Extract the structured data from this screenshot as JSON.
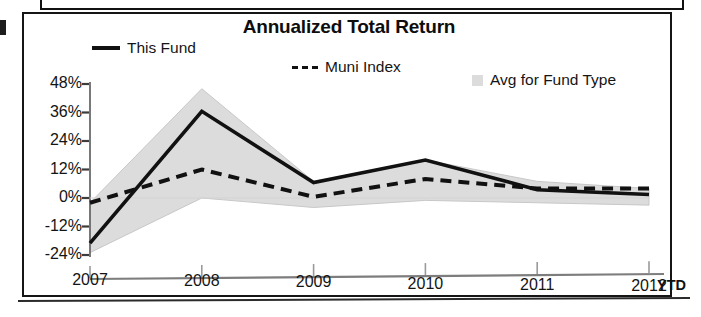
{
  "chart_data": {
    "type": "line",
    "title": "Annualized Total Return",
    "xlabel": "",
    "ylabel": "",
    "x": [
      "2007",
      "2008",
      "2009",
      "2010",
      "2011",
      "2012"
    ],
    "categories": [
      "2007",
      "2008",
      "2009",
      "2010",
      "2011",
      "2012"
    ],
    "x_tick_labels": [
      "2007",
      "2008",
      "2009",
      "2010",
      "2011",
      "2012"
    ],
    "x_axis_note": "YTD",
    "y_tick_labels": [
      "48%",
      "36%",
      "24%",
      "12%",
      "0%",
      "-12%",
      "-24%"
    ],
    "y_tick_values": [
      48,
      36,
      24,
      12,
      0,
      -12,
      -24
    ],
    "ylim": [
      -24,
      48
    ],
    "y_unit": "%",
    "grid": false,
    "legend_position": "top",
    "series": [
      {
        "name": "This Fund",
        "style": "solid",
        "color": "#111111",
        "values": [
          -19.0,
          36.5,
          6.5,
          16.0,
          3.5,
          1.5
        ]
      },
      {
        "name": "Muni Index",
        "style": "dashed",
        "color": "#111111",
        "values": [
          -2.0,
          12.0,
          0.5,
          8.0,
          4.0,
          4.0
        ]
      },
      {
        "name": "Avg for Fund Type",
        "style": "band",
        "color": "#dcdcdc",
        "upper": [
          -2.0,
          46.0,
          7.0,
          16.0,
          7.0,
          4.0
        ],
        "lower": [
          -23.0,
          0.0,
          -4.0,
          -1.0,
          -2.0,
          -3.0
        ]
      }
    ],
    "annotations": []
  },
  "legend": {
    "items": [
      {
        "label": "This Fund",
        "marker": "solid-line-swatch"
      },
      {
        "label": "Muni Index",
        "marker": "dashed-line-swatch"
      },
      {
        "label": "Avg for Fund Type",
        "marker": "gray-square-swatch"
      }
    ]
  },
  "axes": {
    "y_labels": [
      "48%",
      "36%",
      "24%",
      "12%",
      "0%",
      "-12%",
      "-24%"
    ],
    "x_labels": [
      "2007",
      "2008",
      "2009",
      "2010",
      "2011",
      "2012"
    ],
    "ytd_note": "YTD"
  }
}
